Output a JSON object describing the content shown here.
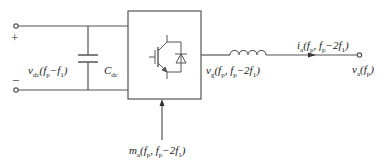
{
  "diagram": {
    "type": "converter-circuit",
    "line_color": "#555555",
    "dc_side": {
      "plus_sign": "+",
      "minus_sign": "−",
      "dc_voltage_label": "v_dc(f_p−f_1)",
      "capacitor_label": "C_dc"
    },
    "converter": {
      "switch_symbol": "igbt-with-antiparallel-diode"
    },
    "ac_side": {
      "converter_voltage_label": "v_g(f_p, f_p−2f_1)",
      "current_label": "i_a(f_p, f_p−2f_1)",
      "grid_voltage_label": "v_a(f_p)",
      "modulation_label": "m_a(f_p, f_p−2f_1)"
    }
  }
}
